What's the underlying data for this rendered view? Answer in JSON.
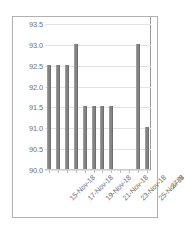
{
  "chart_data": {
    "type": "bar",
    "title": "",
    "subtitle": "",
    "xlabel": "",
    "ylabel": "",
    "grid": true,
    "legend": false,
    "legend_position": "none",
    "bar_color": "#848484",
    "gridline_color": "#e2e2e2",
    "axis_color": "#9a9a9a",
    "label_color": "#6f6f6f",
    "ylim": [
      90.0,
      93.5
    ],
    "ytick_step": 0.5,
    "yticks": [
      "93.5",
      "93.0",
      "92.5",
      "92.0",
      "91.5",
      "91.0",
      "90.5",
      "90.0"
    ],
    "ytick_values": [
      93.5,
      93.0,
      92.5,
      92.0,
      91.5,
      91.0,
      90.5,
      90.0
    ],
    "xticks": [
      "15-Nov-18",
      "17-Nov-18",
      "19-Nov-18",
      "21-Nov-18",
      "23-Nov-18",
      "25-Nov-18",
      "27-N"
    ],
    "categories": [
      "15-Nov-18",
      "16-Nov-18",
      "17-Nov-18",
      "18-Nov-18",
      "19-Nov-18",
      "20-Nov-18",
      "21-Nov-18",
      "22-Nov-18",
      "23-Nov-18",
      "24-Nov-18",
      "25-Nov-18",
      "26-Nov-18"
    ],
    "values": [
      92.5,
      92.5,
      92.5,
      93.0,
      91.5,
      91.5,
      91.5,
      91.5,
      null,
      null,
      93.0,
      91.0
    ]
  }
}
